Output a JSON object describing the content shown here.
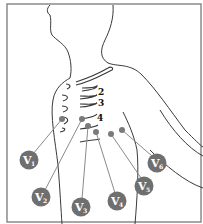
{
  "figure": {
    "intercostal_labels": [
      "2",
      "3",
      "4"
    ],
    "leads": [
      {
        "label": "V",
        "sub": "1",
        "electrode": [
          62,
          119
        ],
        "badge": [
          29,
          160
        ]
      },
      {
        "label": "V",
        "sub": "2",
        "electrode": [
          82,
          119
        ],
        "badge": [
          41,
          197
        ]
      },
      {
        "label": "V",
        "sub": "3",
        "electrode": [
          88,
          126
        ],
        "badge": [
          81,
          207
        ]
      },
      {
        "label": "V",
        "sub": "4",
        "electrode": [
          96,
          132
        ],
        "badge": [
          117,
          201
        ]
      },
      {
        "label": "V",
        "sub": "5",
        "electrode": [
          111,
          134
        ],
        "badge": [
          144,
          186
        ]
      },
      {
        "label": "V",
        "sub": "6",
        "electrode": [
          122,
          130
        ],
        "badge": [
          157,
          163
        ]
      }
    ],
    "colors": {
      "badge": "#6f6f6f",
      "outline": "#3a3a3a",
      "border": "#8a8a8a"
    }
  }
}
